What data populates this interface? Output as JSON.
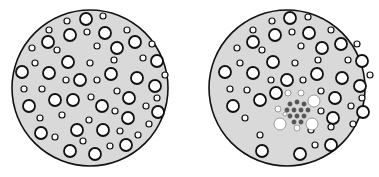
{
  "colors": {
    "background": "#ffffff",
    "disc_fill": "#d9d9d9",
    "outline": "#111111",
    "bubble_fill": "#ffffff",
    "dot_fill": "#555555",
    "faint_outline": "#777777"
  },
  "discs": [
    {
      "name": "left-disc",
      "cx": 90,
      "cy": 88,
      "r": 78,
      "bubbles": [
        [
          86,
          19,
          6
        ],
        [
          103,
          16,
          3
        ],
        [
          67,
          21,
          3
        ],
        [
          49,
          30,
          3
        ],
        [
          70,
          35,
          6
        ],
        [
          87,
          32,
          3
        ],
        [
          105,
          33,
          6
        ],
        [
          127,
          30,
          3
        ],
        [
          48,
          42,
          6
        ],
        [
          57,
          50,
          3
        ],
        [
          32,
          48,
          3
        ],
        [
          97,
          46,
          3
        ],
        [
          117,
          48,
          6
        ],
        [
          135,
          42,
          6
        ],
        [
          152,
          44,
          3
        ],
        [
          68,
          62,
          6
        ],
        [
          35,
          63,
          3
        ],
        [
          90,
          63,
          3
        ],
        [
          114,
          60,
          3
        ],
        [
          143,
          58,
          3
        ],
        [
          157,
          61,
          6
        ],
        [
          22,
          72,
          6
        ],
        [
          49,
          73,
          6
        ],
        [
          66,
          80,
          3
        ],
        [
          80,
          80,
          6
        ],
        [
          97,
          80,
          3
        ],
        [
          111,
          74,
          6
        ],
        [
          137,
          78,
          6
        ],
        [
          165,
          75,
          3
        ],
        [
          24,
          89,
          3
        ],
        [
          42,
          89,
          3
        ],
        [
          155,
          86,
          6
        ],
        [
          117,
          91,
          3
        ],
        [
          157,
          98,
          3
        ],
        [
          29,
          106,
          6
        ],
        [
          55,
          100,
          6
        ],
        [
          73,
          100,
          6
        ],
        [
          91,
          97,
          3
        ],
        [
          102,
          106,
          6
        ],
        [
          129,
          98,
          6
        ],
        [
          146,
          106,
          3
        ],
        [
          158,
          112,
          6
        ],
        [
          40,
          118,
          3
        ],
        [
          62,
          115,
          3
        ],
        [
          89,
          120,
          3
        ],
        [
          115,
          111,
          3
        ],
        [
          128,
          118,
          6
        ],
        [
          149,
          124,
          3
        ],
        [
          41,
          133,
          6
        ],
        [
          55,
          137,
          3
        ],
        [
          77,
          130,
          6
        ],
        [
          103,
          130,
          6
        ],
        [
          120,
          131,
          3
        ],
        [
          138,
          135,
          3
        ],
        [
          83,
          141,
          3
        ],
        [
          110,
          146,
          3
        ],
        [
          70,
          151,
          6
        ],
        [
          95,
          154,
          6
        ],
        [
          126,
          145,
          6
        ]
      ],
      "dots": [],
      "faint_rings": []
    },
    {
      "name": "right-disc",
      "cx": 287,
      "cy": 88,
      "r": 78,
      "bubbles": [
        [
          290,
          18,
          6
        ],
        [
          308,
          17,
          3
        ],
        [
          272,
          21,
          3
        ],
        [
          253,
          30,
          3
        ],
        [
          275,
          35,
          6
        ],
        [
          292,
          32,
          3
        ],
        [
          309,
          33,
          6
        ],
        [
          331,
          30,
          3
        ],
        [
          253,
          42,
          6
        ],
        [
          262,
          50,
          3
        ],
        [
          237,
          48,
          3
        ],
        [
          301,
          46,
          3
        ],
        [
          322,
          48,
          6
        ],
        [
          341,
          44,
          6
        ],
        [
          357,
          44,
          3
        ],
        [
          273,
          62,
          6
        ],
        [
          240,
          63,
          3
        ],
        [
          295,
          63,
          3
        ],
        [
          318,
          60,
          3
        ],
        [
          348,
          60,
          3
        ],
        [
          362,
          61,
          6
        ],
        [
          225,
          72,
          6
        ],
        [
          253,
          73,
          6
        ],
        [
          271,
          80,
          3
        ],
        [
          287,
          80,
          6
        ],
        [
          303,
          80,
          3
        ],
        [
          317,
          74,
          6
        ],
        [
          342,
          78,
          6
        ],
        [
          370,
          75,
          3
        ],
        [
          230,
          89,
          3
        ],
        [
          247,
          90,
          3
        ],
        [
          276,
          93,
          6
        ],
        [
          321,
          91,
          3
        ],
        [
          360,
          86,
          6
        ],
        [
          362,
          98,
          3
        ],
        [
          233,
          106,
          6
        ],
        [
          260,
          100,
          6
        ],
        [
          335,
          98,
          6
        ],
        [
          351,
          106,
          3
        ],
        [
          363,
          112,
          6
        ],
        [
          245,
          118,
          3
        ],
        [
          321,
          111,
          3
        ],
        [
          333,
          118,
          6
        ],
        [
          353,
          124,
          3
        ],
        [
          260,
          135,
          3
        ],
        [
          311,
          130,
          3
        ],
        [
          331,
          127,
          3
        ],
        [
          262,
          151,
          6
        ],
        [
          300,
          154,
          6
        ],
        [
          315,
          145,
          3
        ],
        [
          331,
          145,
          6
        ]
      ],
      "dots": [
        [
          290,
          104
        ],
        [
          297,
          102
        ],
        [
          304,
          104
        ],
        [
          287,
          110
        ],
        [
          294,
          110
        ],
        [
          301,
          110
        ],
        [
          308,
          110
        ],
        [
          290,
          116
        ],
        [
          297,
          116
        ],
        [
          304,
          116
        ],
        [
          294,
          122
        ],
        [
          301,
          122
        ]
      ],
      "faint_rings": [
        [
          288,
          93,
          3
        ],
        [
          301,
          93,
          3
        ],
        [
          278,
          109,
          3
        ],
        [
          314,
          101,
          6
        ],
        [
          280,
          124,
          6
        ],
        [
          312,
          124,
          6
        ],
        [
          297,
          128,
          3
        ],
        [
          285,
          114,
          2
        ]
      ]
    }
  ]
}
